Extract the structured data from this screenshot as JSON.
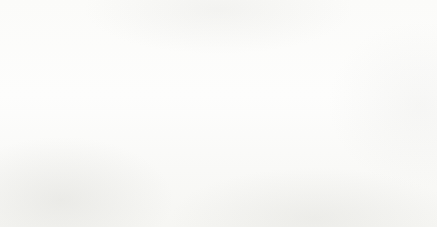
{
  "chart_data": {
    "type": "bar",
    "title": "",
    "subtitle": "",
    "xlabel": "",
    "ylabel": "",
    "categories": [
      "2010",
      "2011",
      "2012",
      "2013",
      "2014",
      "2015",
      "2016",
      "2017",
      "2018"
    ],
    "values": [
      593187,
      625981,
      651291,
      694101,
      676342,
      733850,
      808788,
      955499,
      1076848
    ],
    "value_labels": [
      "593,187",
      "625,981",
      "651,291",
      "694,101",
      "676,342",
      "733,850",
      "808,788",
      "955,499",
      "1,076,848"
    ],
    "ylim": [
      0,
      1200000
    ],
    "ytick_values": [
      0,
      200000,
      400000,
      600000,
      800000,
      1000000,
      1200000
    ],
    "ytick_labels": [
      "0",
      "200,000",
      "400,000",
      "600,000",
      "800,000",
      "1,000,000",
      "1,200,000"
    ],
    "grid": true,
    "legend": false,
    "legend_position": "none",
    "series": [
      {
        "name": "",
        "values": [
          593187,
          625981,
          651291,
          694101,
          676342,
          733850,
          808788,
          955499,
          1076848
        ]
      }
    ],
    "colors": {
      "bar": "#a72a1e",
      "gridline": "#d2d2d2",
      "axis": "#b9b9b9",
      "label_text": "#3b3b3b",
      "background": "#fdfdfb"
    }
  }
}
